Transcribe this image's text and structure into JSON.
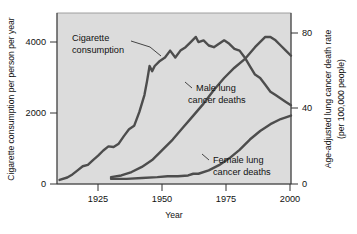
{
  "chart_data": {
    "type": "line",
    "title": "",
    "xlabel": "Year",
    "ylabel_left": "Cigarette consumption per person per year",
    "ylabel_right_line1": "Age-adjusted lung cancer death rate",
    "ylabel_right_line2": "(per 100,000 people)",
    "grid": false,
    "legend": "annotations-inline",
    "xlim": [
      1909,
      2000
    ],
    "x_ticks": [
      "1925",
      "1950",
      "1975",
      "2000"
    ],
    "x_tick_values": [
      1925,
      1950,
      1975,
      2000
    ],
    "ylim_left": [
      0,
      5000
    ],
    "y_ticks_left": [
      "0",
      "2000",
      "4000"
    ],
    "y_tick_values_left": [
      0,
      2000,
      4000
    ],
    "ylim_right": [
      0,
      100
    ],
    "y_ticks_right": [
      "0",
      "40",
      "80"
    ],
    "y_tick_values_right": [
      0,
      40,
      80
    ],
    "plot_background": "#dcdcdc",
    "line_color": "#4d4d4d",
    "series": [
      {
        "name": "Cigarette consumption",
        "axis": "left",
        "annotation": "Cigarette consumption",
        "x": [
          1910,
          1913,
          1915,
          1917,
          1919,
          1921,
          1923,
          1925,
          1927,
          1929,
          1931,
          1933,
          1935,
          1937,
          1939,
          1941,
          1943,
          1944,
          1945,
          1946,
          1947,
          1949,
          1951,
          1953,
          1955,
          1957,
          1959,
          1961,
          1963,
          1964,
          1966,
          1968,
          1970,
          1972,
          1974,
          1976,
          1978,
          1980,
          1982,
          1984,
          1986,
          1988,
          1990,
          1992,
          1994,
          1996,
          1998,
          2000
        ],
        "values": [
          120,
          190,
          280,
          400,
          520,
          560,
          700,
          830,
          980,
          1100,
          1080,
          1180,
          1400,
          1600,
          1700,
          2100,
          2600,
          3000,
          3450,
          3300,
          3450,
          3600,
          3700,
          3900,
          3700,
          3900,
          4000,
          4150,
          4300,
          4150,
          4200,
          4050,
          4000,
          4100,
          4200,
          4100,
          3950,
          3900,
          3700,
          3450,
          3200,
          3100,
          2900,
          2700,
          2600,
          2500,
          2400,
          2300
        ]
      },
      {
        "name": "Male lung cancer deaths",
        "axis": "right",
        "annotation": "Male lung cancer deaths",
        "x": [
          1930,
          1934,
          1938,
          1942,
          1946,
          1950,
          1954,
          1958,
          1962,
          1966,
          1970,
          1974,
          1978,
          1982,
          1986,
          1990,
          1992,
          1994,
          1996,
          1998,
          2000
        ],
        "values": [
          4,
          5,
          7,
          10,
          14,
          20,
          26,
          33,
          40,
          47,
          55,
          62,
          68,
          73,
          80,
          86,
          86,
          84,
          81,
          78,
          75
        ]
      },
      {
        "name": "Female lung cancer deaths",
        "axis": "right",
        "annotation": "Female lung cancer deaths",
        "x": [
          1930,
          1936,
          1942,
          1948,
          1952,
          1956,
          1960,
          1962,
          1964,
          1968,
          1972,
          1976,
          1980,
          1984,
          1988,
          1992,
          1996,
          2000
        ],
        "values": [
          3,
          3,
          3.5,
          4,
          4.5,
          4.5,
          5,
          6,
          6,
          8,
          11,
          15,
          20,
          26,
          31,
          35,
          38,
          40
        ]
      }
    ]
  },
  "annotations": {
    "cigarette_line1": "Cigarette",
    "cigarette_line2": "consumption",
    "male_line1": "Male lung",
    "male_line2": "cancer deaths",
    "female_line1": "Female lung",
    "female_line2": "cancer deaths"
  },
  "axes": {
    "x_title": "Year",
    "y_left_title": "Cigarette consumption per person per year",
    "y_right_title_line1": "Age-adjusted lung cancer death rate",
    "y_right_title_line2": "(per 100,000 people)",
    "x_tick_0": "1925",
    "x_tick_1": "1950",
    "x_tick_2": "1975",
    "x_tick_3": "2000",
    "y_left_tick_0": "0",
    "y_left_tick_1": "2000",
    "y_left_tick_2": "4000",
    "y_right_tick_0": "0",
    "y_right_tick_1": "40",
    "y_right_tick_2": "80"
  }
}
